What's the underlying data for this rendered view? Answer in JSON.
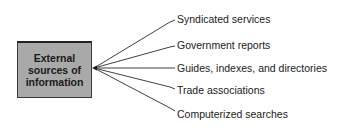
{
  "diagram": {
    "root": {
      "label": "External\nsources of\ninformation",
      "fill": "#a9a9a9"
    },
    "branches": [
      {
        "label": "Syndicated services"
      },
      {
        "label": "Government reports"
      },
      {
        "label": "Guides, indexes, and directories"
      },
      {
        "label": "Trade associations"
      },
      {
        "label": "Computerized searches"
      }
    ]
  }
}
